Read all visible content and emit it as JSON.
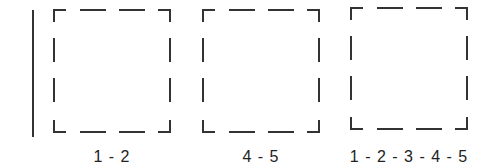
{
  "diagram": {
    "stroke_color": "#333333",
    "boxes": [
      {
        "label": "1 - 2"
      },
      {
        "label": "4 - 5"
      },
      {
        "label": "1 - 2 - 3 - 4 - 5"
      }
    ]
  }
}
